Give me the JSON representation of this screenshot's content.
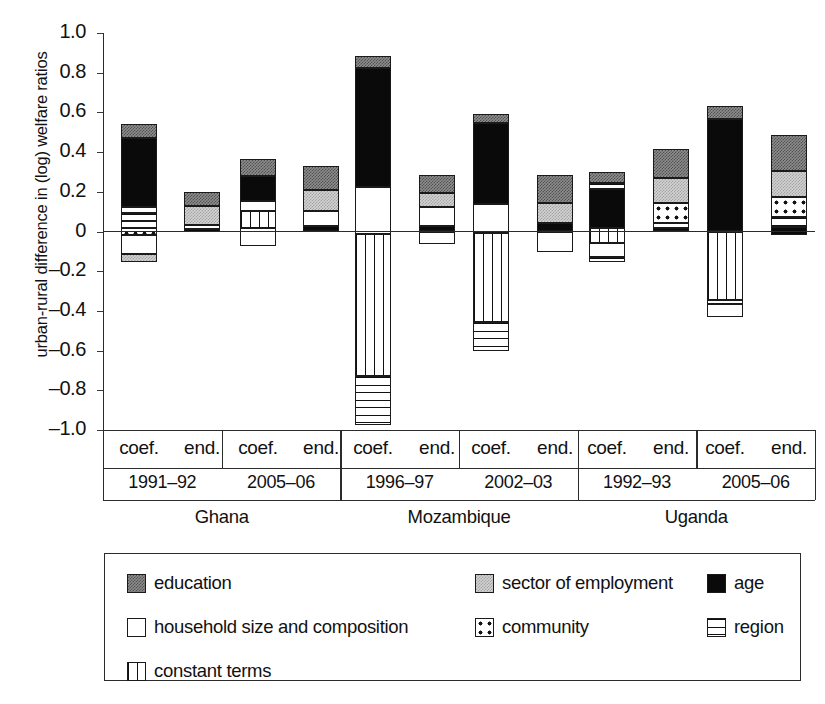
{
  "chart_data": {
    "type": "bar",
    "subtype": "stacked-diverging",
    "title": "",
    "xlabel": "",
    "ylabel": "urban-rural difference in (log) welfare ratios",
    "ylim": [
      -1.0,
      1.0
    ],
    "ytick_labels": [
      "1.0",
      "0.8",
      "0.6",
      "0.4",
      "0.2",
      "0",
      "–0.2",
      "–0.4",
      "–0.6",
      "–0.8",
      "–1.0"
    ],
    "ytick_values": [
      1.0,
      0.8,
      0.6,
      0.4,
      0.2,
      0,
      -0.2,
      -0.4,
      -0.6,
      -0.8,
      -1.0
    ],
    "grid": false,
    "legend_position": "bottom",
    "series_names": [
      "education",
      "sector of employment",
      "age",
      "household size and composition",
      "community",
      "region",
      "constant terms"
    ],
    "countries": [
      "Ghana",
      "Mozambique",
      "Uganda"
    ],
    "periods": [
      "1991–92",
      "2005–06",
      "1996–97",
      "2002–03",
      "1992–93",
      "2005–06"
    ],
    "decomposition_types": [
      "coef.",
      "end."
    ],
    "columns": [
      {
        "country": "Ghana",
        "period": "1991–92",
        "type": "coef.",
        "total_top": 0.54,
        "total_bottom": -0.155,
        "segments": [
          {
            "name": "education",
            "start": 0.47,
            "end": 0.54
          },
          {
            "name": "age",
            "start": 0.125,
            "end": 0.47
          },
          {
            "name": "household size and composition",
            "start": 0.095,
            "end": 0.125
          },
          {
            "name": "region",
            "start": 0.055,
            "end": 0.095
          },
          {
            "name": "household size and composition",
            "start": 0.02,
            "end": 0.055
          },
          {
            "name": "community",
            "start": -0.02,
            "end": 0.02
          },
          {
            "name": "household size and composition",
            "start": -0.115,
            "end": -0.02
          },
          {
            "name": "sector of employment",
            "start": -0.155,
            "end": -0.115
          }
        ]
      },
      {
        "country": "Ghana",
        "period": "1991–92",
        "type": "end.",
        "total_top": 0.2,
        "total_bottom": -0.005,
        "segments": [
          {
            "name": "education",
            "start": 0.13,
            "end": 0.2
          },
          {
            "name": "sector of employment",
            "start": 0.035,
            "end": 0.13
          },
          {
            "name": "household size and composition",
            "start": 0.015,
            "end": 0.035
          },
          {
            "name": "age",
            "start": -0.005,
            "end": 0.015
          }
        ]
      },
      {
        "country": "Ghana",
        "period": "2005–06",
        "type": "coef.",
        "total_top": 0.365,
        "total_bottom": -0.075,
        "segments": [
          {
            "name": "education",
            "start": 0.28,
            "end": 0.365
          },
          {
            "name": "age",
            "start": 0.155,
            "end": 0.28
          },
          {
            "name": "household size and composition",
            "start": 0.105,
            "end": 0.155
          },
          {
            "name": "constant terms",
            "start": 0.02,
            "end": 0.105
          },
          {
            "name": "household size and composition",
            "start": -0.075,
            "end": 0.02
          }
        ]
      },
      {
        "country": "Ghana",
        "period": "2005–06",
        "type": "end.",
        "total_top": 0.33,
        "total_bottom": 0.0,
        "segments": [
          {
            "name": "education",
            "start": 0.21,
            "end": 0.33
          },
          {
            "name": "sector of employment",
            "start": 0.105,
            "end": 0.21
          },
          {
            "name": "household size and composition",
            "start": 0.03,
            "end": 0.105
          },
          {
            "name": "age",
            "start": 0.0,
            "end": 0.03
          }
        ]
      },
      {
        "country": "Mozambique",
        "period": "1996–97",
        "type": "coef.",
        "total_top": 0.885,
        "total_bottom": -0.975,
        "segments": [
          {
            "name": "education",
            "start": 0.825,
            "end": 0.885
          },
          {
            "name": "age",
            "start": 0.225,
            "end": 0.825
          },
          {
            "name": "household size and composition",
            "start": -0.015,
            "end": 0.225
          },
          {
            "name": "constant terms",
            "start": -0.73,
            "end": -0.015
          },
          {
            "name": "region",
            "start": -0.975,
            "end": -0.73
          }
        ]
      },
      {
        "country": "Mozambique",
        "period": "1996–97",
        "type": "end.",
        "total_top": 0.285,
        "total_bottom": -0.065,
        "segments": [
          {
            "name": "education",
            "start": 0.195,
            "end": 0.285
          },
          {
            "name": "sector of employment",
            "start": 0.125,
            "end": 0.195
          },
          {
            "name": "household size and composition",
            "start": 0.03,
            "end": 0.125
          },
          {
            "name": "age",
            "start": 0.0,
            "end": 0.03
          },
          {
            "name": "household size and composition",
            "start": -0.065,
            "end": 0.0
          }
        ]
      },
      {
        "country": "Mozambique",
        "period": "2002–03",
        "type": "coef.",
        "total_top": 0.59,
        "total_bottom": -0.6,
        "segments": [
          {
            "name": "education",
            "start": 0.545,
            "end": 0.59
          },
          {
            "name": "age",
            "start": 0.14,
            "end": 0.545
          },
          {
            "name": "household size and composition",
            "start": -0.01,
            "end": 0.14
          },
          {
            "name": "constant terms",
            "start": -0.455,
            "end": -0.01
          },
          {
            "name": "region",
            "start": -0.6,
            "end": -0.455
          }
        ]
      },
      {
        "country": "Mozambique",
        "period": "2002–03",
        "type": "end.",
        "total_top": 0.285,
        "total_bottom": -0.105,
        "segments": [
          {
            "name": "education",
            "start": 0.145,
            "end": 0.285
          },
          {
            "name": "sector of employment",
            "start": 0.045,
            "end": 0.145
          },
          {
            "name": "age",
            "start": 0.0,
            "end": 0.045
          },
          {
            "name": "household size and composition",
            "start": -0.105,
            "end": 0.0
          }
        ]
      },
      {
        "country": "Uganda",
        "period": "1992–93",
        "type": "coef.",
        "total_top": 0.3,
        "total_bottom": -0.155,
        "segments": [
          {
            "name": "education",
            "start": 0.245,
            "end": 0.3
          },
          {
            "name": "region",
            "start": 0.215,
            "end": 0.245
          },
          {
            "name": "age",
            "start": 0.02,
            "end": 0.215
          },
          {
            "name": "constant terms",
            "start": -0.06,
            "end": 0.02
          },
          {
            "name": "household size and composition",
            "start": -0.13,
            "end": -0.06
          },
          {
            "name": "region",
            "start": -0.155,
            "end": -0.13
          }
        ]
      },
      {
        "country": "Uganda",
        "period": "1992–93",
        "type": "end.",
        "total_top": 0.415,
        "total_bottom": 0.0,
        "segments": [
          {
            "name": "education",
            "start": 0.27,
            "end": 0.415
          },
          {
            "name": "sector of employment",
            "start": 0.145,
            "end": 0.27
          },
          {
            "name": "community",
            "start": 0.045,
            "end": 0.145
          },
          {
            "name": "household size and composition",
            "start": 0.02,
            "end": 0.045
          },
          {
            "name": "age",
            "start": 0.0,
            "end": 0.02
          }
        ]
      },
      {
        "country": "Uganda",
        "period": "2005–06",
        "type": "coef.",
        "total_top": 0.63,
        "total_bottom": -0.43,
        "segments": [
          {
            "name": "education",
            "start": 0.565,
            "end": 0.63
          },
          {
            "name": "age",
            "start": 0.0,
            "end": 0.565
          },
          {
            "name": "constant terms",
            "start": -0.345,
            "end": 0.0
          },
          {
            "name": "community",
            "start": -0.365,
            "end": -0.345
          },
          {
            "name": "household size and composition",
            "start": -0.43,
            "end": -0.365
          }
        ]
      },
      {
        "country": "Uganda",
        "period": "2005–06",
        "type": "end.",
        "total_top": 0.485,
        "total_bottom": -0.02,
        "segments": [
          {
            "name": "education",
            "start": 0.305,
            "end": 0.485
          },
          {
            "name": "sector of employment",
            "start": 0.175,
            "end": 0.305
          },
          {
            "name": "community",
            "start": 0.075,
            "end": 0.175
          },
          {
            "name": "region",
            "start": 0.025,
            "end": 0.075
          },
          {
            "name": "age",
            "start": -0.02,
            "end": 0.025
          }
        ]
      }
    ]
  },
  "legend": {
    "items": [
      {
        "label": "education",
        "pattern": "education"
      },
      {
        "label": "sector of employment",
        "pattern": "sector"
      },
      {
        "label": "age",
        "pattern": "age"
      },
      {
        "label": "household size and composition",
        "pattern": "household"
      },
      {
        "label": "community",
        "pattern": "community"
      },
      {
        "label": "region",
        "pattern": "region"
      },
      {
        "label": "constant terms",
        "pattern": "constant"
      }
    ]
  }
}
